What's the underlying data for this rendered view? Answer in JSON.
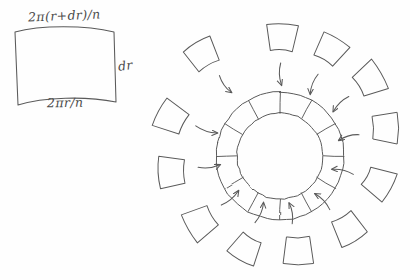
{
  "figure": {
    "type": "hand-drawn-diagram",
    "background_color": "#fefefe",
    "ink_color": "#5a5a5a"
  },
  "detail_panel": {
    "name": "unrolled-segment-detail",
    "shape": "curved quadrilateral (annulus segment)",
    "labels": {
      "top_arc": "2π(r+dr)/n",
      "bottom_arc": "2πr/n",
      "side": "dr"
    },
    "geometry": {
      "left": 14,
      "top": 30,
      "right": 115,
      "bottom": 106
    }
  },
  "annulus": {
    "name": "segmented-annulus",
    "center_x": 280,
    "center_y": 156,
    "outer_radius": 64,
    "inner_radius": 43,
    "segment_count": 12,
    "segment_angle_deg": 30
  },
  "exploded_segments": {
    "count": 12,
    "description": "Twelve detached annulus segments arranged radially around the ring, each with an arrow pointing back toward the ring",
    "items": [
      {
        "index": 0,
        "cx": 282,
        "cy": 38,
        "rot": 2,
        "arrow_angle_deg": 90
      },
      {
        "index": 1,
        "cx": 330,
        "cy": 50,
        "rot": 32,
        "arrow_angle_deg": 120
      },
      {
        "index": 2,
        "cx": 369,
        "cy": 80,
        "rot": 60,
        "arrow_angle_deg": 150
      },
      {
        "index": 3,
        "cx": 385,
        "cy": 128,
        "rot": 90,
        "arrow_angle_deg": 180
      },
      {
        "index": 4,
        "cx": 378,
        "cy": 182,
        "rot": 118,
        "arrow_angle_deg": 210
      },
      {
        "index": 5,
        "cx": 348,
        "cy": 228,
        "rot": 150,
        "arrow_angle_deg": 240
      },
      {
        "index": 6,
        "cx": 298,
        "cy": 250,
        "rot": 180,
        "arrow_angle_deg": 270
      },
      {
        "index": 7,
        "cx": 246,
        "cy": 248,
        "rot": 210,
        "arrow_angle_deg": 300
      },
      {
        "index": 8,
        "cx": 201,
        "cy": 222,
        "rot": 240,
        "arrow_angle_deg": 330
      },
      {
        "index": 9,
        "cx": 172,
        "cy": 172,
        "rot": 268,
        "arrow_angle_deg": 0
      },
      {
        "index": 10,
        "cx": 172,
        "cy": 118,
        "rot": 298,
        "arrow_angle_deg": 30
      },
      {
        "index": 11,
        "cx": 203,
        "cy": 55,
        "rot": 330,
        "arrow_angle_deg": 60
      }
    ]
  }
}
